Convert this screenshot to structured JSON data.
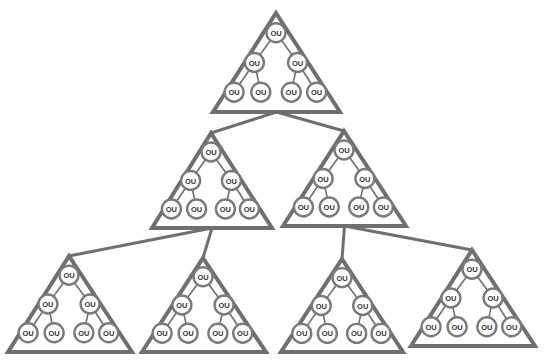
{
  "diagram": {
    "type": "hierarchical-tree-of-trees",
    "node_label": "OU",
    "colors": {
      "stroke": "#6f6f6f",
      "node_stroke": "#7a7a7a",
      "text": "#333333",
      "background": "#ffffff"
    },
    "triangles": [
      {
        "id": "top",
        "apex": [
          276,
          13
        ],
        "base_y": 112,
        "base_left": 213,
        "base_right": 340
      },
      {
        "id": "mid-left",
        "apex": [
          211,
          133
        ],
        "base_y": 228,
        "base_left": 152,
        "base_right": 272
      },
      {
        "id": "mid-right",
        "apex": [
          344,
          131
        ],
        "base_y": 226,
        "base_left": 283,
        "base_right": 406
      },
      {
        "id": "bottom-1",
        "apex": [
          69,
          256
        ],
        "base_y": 352,
        "base_left": 8,
        "base_right": 132
      },
      {
        "id": "bottom-2",
        "apex": [
          203,
          258
        ],
        "base_y": 352,
        "base_left": 142,
        "base_right": 266
      },
      {
        "id": "bottom-3",
        "apex": [
          342,
          259
        ],
        "base_y": 352,
        "base_left": 281,
        "base_right": 403
      },
      {
        "id": "bottom-4",
        "apex": [
          472,
          250
        ],
        "base_y": 346,
        "base_left": 411,
        "base_right": 535
      }
    ],
    "links": [
      {
        "from": "top",
        "to": "mid-left"
      },
      {
        "from": "top",
        "to": "mid-right"
      },
      {
        "from": "mid-left",
        "to": "bottom-1"
      },
      {
        "from": "mid-left",
        "to": "bottom-2"
      },
      {
        "from": "mid-right",
        "to": "bottom-3"
      },
      {
        "from": "mid-right",
        "to": "bottom-4"
      }
    ],
    "tree_per_triangle": {
      "levels": 3,
      "nodes_per_level": [
        1,
        2,
        4
      ],
      "labels": [
        "OU",
        "OU",
        "OU",
        "OU",
        "OU",
        "OU",
        "OU"
      ]
    }
  }
}
